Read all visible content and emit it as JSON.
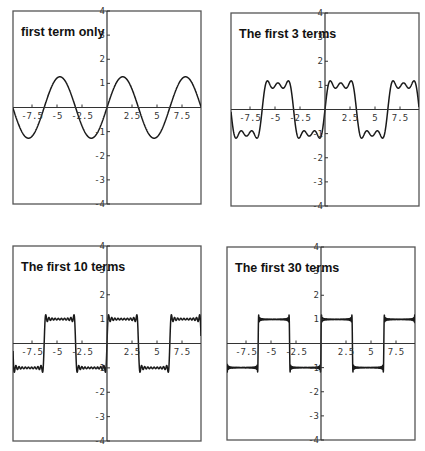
{
  "chart_data": [
    {
      "type": "line",
      "title": "first term only",
      "terms": 1,
      "function": "(4/pi) * sum_{k=1..N} sin((2k-1)x)/(2k-1)",
      "xlim": [
        -9.4,
        9.4
      ],
      "ylim": [
        -4,
        4
      ],
      "x_ticks": [
        -7.5,
        -5,
        -2.5,
        2.5,
        5,
        7.5
      ],
      "x_tick_labels": [
        "-7.5",
        "-5",
        "-2.5",
        "2.5",
        "5",
        "7.5"
      ],
      "y_ticks": [
        -4,
        -3,
        -2,
        -1,
        1,
        2,
        3,
        4
      ],
      "y_tick_labels": [
        "-4",
        "-3",
        "-2",
        "-1",
        "1",
        "2",
        "3",
        "4"
      ],
      "xlabel": "",
      "ylabel": "",
      "grid": false,
      "frame": {
        "left": 13,
        "top": 11,
        "width": 188,
        "height": 193
      }
    },
    {
      "type": "line",
      "title": "The first 3 terms",
      "terms": 3,
      "function": "(4/pi) * sum_{k=1..N} sin((2k-1)x)/(2k-1)",
      "xlim": [
        -9.4,
        9.4
      ],
      "ylim": [
        -4,
        4
      ],
      "x_ticks": [
        -7.5,
        -5,
        -2.5,
        2.5,
        5,
        7.5
      ],
      "x_tick_labels": [
        "-7.5",
        "-5",
        "-2.5",
        "2.5",
        "5",
        "7.5"
      ],
      "y_ticks": [
        -4,
        -3,
        -2,
        -1,
        1,
        2,
        3,
        4
      ],
      "y_tick_labels": [
        "-4",
        "-3",
        "-2",
        "-1",
        "1",
        "2",
        "3",
        "4"
      ],
      "xlabel": "",
      "ylabel": "",
      "grid": false,
      "frame": {
        "left": 231,
        "top": 13,
        "width": 188,
        "height": 193
      }
    },
    {
      "type": "line",
      "title": "The first 10 terms",
      "terms": 10,
      "function": "(4/pi) * sum_{k=1..N} sin((2k-1)x)/(2k-1)",
      "xlim": [
        -9.4,
        9.4
      ],
      "ylim": [
        -4,
        4
      ],
      "x_ticks": [
        -7.5,
        -5,
        -2.5,
        2.5,
        5,
        7.5
      ],
      "x_tick_labels": [
        "-7.5",
        "-5",
        "-2.5",
        "2.5",
        "5",
        "7.5"
      ],
      "y_ticks": [
        -4,
        -3,
        -2,
        -1,
        1,
        2,
        3,
        4
      ],
      "y_tick_labels": [
        "-4",
        "-3",
        "-2",
        "-1",
        "1",
        "2",
        "3",
        "4"
      ],
      "xlabel": "",
      "ylabel": "",
      "grid": false,
      "frame": {
        "left": 13,
        "top": 246,
        "width": 188,
        "height": 195
      }
    },
    {
      "type": "line",
      "title": "The first 30 terms",
      "terms": 30,
      "function": "(4/pi) * sum_{k=1..N} sin((2k-1)x)/(2k-1)",
      "xlim": [
        -9.4,
        9.4
      ],
      "ylim": [
        -4,
        4
      ],
      "x_ticks": [
        -7.5,
        -5,
        -2.5,
        2.5,
        5,
        7.5
      ],
      "x_tick_labels": [
        "-7.5",
        "-5",
        "-2.5",
        "2.5",
        "5",
        "7.5"
      ],
      "y_ticks": [
        -4,
        -3,
        -2,
        -1,
        1,
        2,
        3,
        4
      ],
      "y_tick_labels": [
        "-4",
        "-3",
        "-2",
        "-1",
        "1",
        "2",
        "3",
        "4"
      ],
      "xlabel": "",
      "ylabel": "",
      "grid": false,
      "frame": {
        "left": 227,
        "top": 247,
        "width": 188,
        "height": 193
      }
    }
  ],
  "style": {
    "curve_color": "#1a1a1a",
    "axis_color": "#333333",
    "frame_color": "#555555",
    "background": "#ffffff"
  }
}
